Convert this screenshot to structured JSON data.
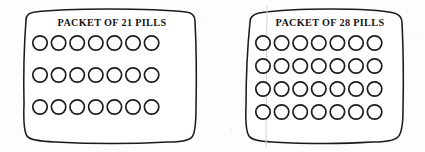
{
  "figure": {
    "background_color": "#fdfdfd",
    "ink_color": "#1b1b1b",
    "width": 425,
    "height": 152
  },
  "packets": [
    {
      "id": "packet-21",
      "caption": "PACKET OF 21 PILLS",
      "pill_count": 21,
      "rows": 3,
      "columns": 7,
      "caption_x": 112,
      "caption_y": 26,
      "outline_path": "M 26 20 Q 26 13 35 12 Q 60 9 108 9 Q 160 9 186 12 Q 195 13 195 21 Q 197 60 196 108 Q 196 132 192 137 Q 188 142 168 142 Q 112 145 55 142 Q 30 141 27 136 Q 23 130 24 104 Q 23 60 26 20 Z",
      "circle_radius": 7.2,
      "first_circle_x": 40,
      "column_pitch": 18.6,
      "row_centers": [
        43,
        75,
        107
      ]
    },
    {
      "id": "packet-28",
      "caption": "PACKET OF 28 PILLS",
      "pill_count": 28,
      "rows": 4,
      "columns": 7,
      "caption_x": 330,
      "caption_y": 26,
      "outline_path": "M 250 22 Q 250 15 259 13 Q 286 9 330 9 Q 376 9 394 13 Q 402 15 402 23 Q 404 62 403 110 Q 403 132 398 137 Q 393 142 372 142 Q 328 145 272 142 Q 252 141 249 136 Q 245 130 246 106 Q 246 62 250 22 Z",
      "circle_radius": 7.2,
      "first_circle_x": 263,
      "column_pitch": 18.6,
      "row_centers": [
        43,
        66,
        89,
        112
      ],
      "fold_line_x": 267
    }
  ]
}
